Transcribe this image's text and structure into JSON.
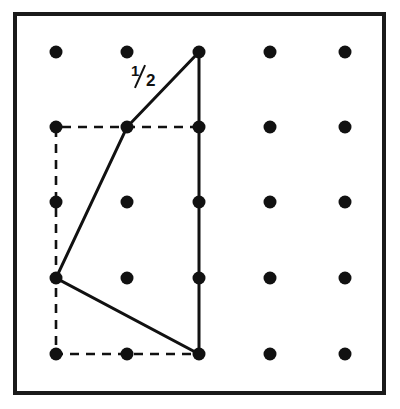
{
  "figure": {
    "background_color": "#ffffff",
    "ink_color": "#111111",
    "border": {
      "name": "outer-frame",
      "x": 15,
      "y": 14,
      "width": 369,
      "height": 379,
      "stroke_width": 4,
      "color": "#1a1a1a"
    },
    "lattice": {
      "rows": 5,
      "cols": 5,
      "col_x": [
        56,
        127,
        199,
        270,
        345
      ],
      "row_y": [
        52,
        127,
        202,
        278,
        354
      ],
      "dot_radius": 6.5,
      "dot_color": "#111111"
    },
    "solid_polygon": {
      "name": "solid-quadrilateral",
      "stroke_width": 3,
      "color": "#111111",
      "fill": "none",
      "vertices_rc": [
        {
          "col": 2,
          "row": 0
        },
        {
          "col": 2,
          "row": 4
        },
        {
          "col": 0,
          "row": 3
        },
        {
          "col": 1,
          "row": 1
        }
      ],
      "points": "199,52 199,354 56,278 127,127"
    },
    "dashed_rectangle": {
      "name": "dashed-bounding-rectangle",
      "stroke_width": 2.6,
      "color": "#111111",
      "dash_pattern": "9 7",
      "fill": "none",
      "corners_rc": [
        {
          "col": 0,
          "row": 1
        },
        {
          "col": 2,
          "row": 1
        },
        {
          "col": 2,
          "row": 4
        },
        {
          "col": 0,
          "row": 4
        }
      ],
      "visible_edges": [
        "top",
        "left",
        "bottom"
      ],
      "points": "199,127 56,127 56,354 199,354"
    },
    "annotations": [
      {
        "name": "one-half-label",
        "text": "1/2",
        "numerator": "1",
        "denominator": "2",
        "x": 131,
        "y": 63,
        "style": "bold-slanted-fraction"
      }
    ]
  }
}
